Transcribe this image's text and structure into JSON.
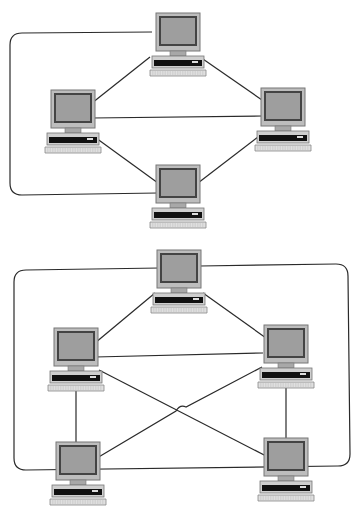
{
  "diagrams": [
    {
      "name": "ring-topology-with-extra-links",
      "nodes": [
        {
          "id": "top",
          "x": 150,
          "y": 13
        },
        {
          "id": "left",
          "x": 45,
          "y": 90
        },
        {
          "id": "right",
          "x": 255,
          "y": 88
        },
        {
          "id": "bottom",
          "x": 150,
          "y": 165
        }
      ]
    },
    {
      "name": "mesh-topology-five-nodes",
      "nodes": [
        {
          "id": "top",
          "x": 151,
          "y": 250
        },
        {
          "id": "left",
          "x": 48,
          "y": 328
        },
        {
          "id": "right",
          "x": 258,
          "y": 325
        },
        {
          "id": "bottom-left",
          "x": 50,
          "y": 442
        },
        {
          "id": "bottom-right",
          "x": 258,
          "y": 438
        }
      ]
    }
  ],
  "colors": {
    "line": "#2a2a2a",
    "case": "#cfcfcf",
    "screen": "#9a9a9a",
    "bezel": "#555555",
    "drive": "#111111",
    "keyboard": "#dcdcdc"
  }
}
